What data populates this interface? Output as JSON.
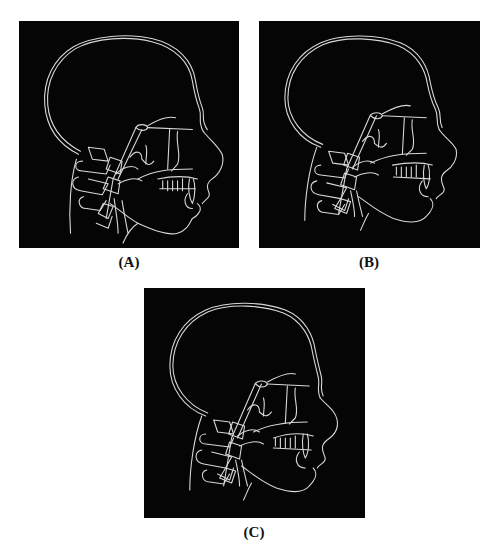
{
  "figure": {
    "background": "#ffffff",
    "panel_background": "#050505",
    "line_color": "#d8d8d8",
    "panels": [
      {
        "id": "A",
        "label": "(A)",
        "content": "lateral cephalometric skull tracing"
      },
      {
        "id": "B",
        "label": "(B)",
        "content": "lateral cephalometric skull tracing"
      },
      {
        "id": "C",
        "label": "(C)",
        "content": "lateral cephalometric skull tracing"
      }
    ]
  }
}
